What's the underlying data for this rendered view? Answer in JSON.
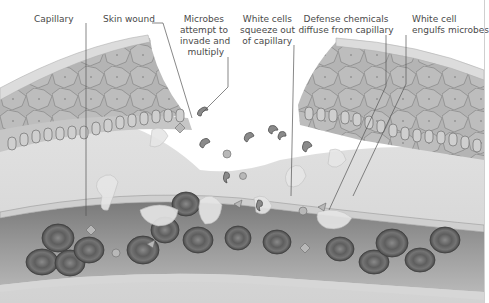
{
  "diagram": {
    "type": "illustration",
    "style": "grayscale",
    "labels": [
      {
        "id": "capillary",
        "text": "Capillary"
      },
      {
        "id": "skin_wound",
        "text": "Skin wound"
      },
      {
        "id": "microbes",
        "lines": [
          "Microbes",
          "attempt to",
          "invade and",
          "multiply"
        ]
      },
      {
        "id": "white_cells_squeeze",
        "lines": [
          "White cells",
          "squeeze out",
          "of capillary"
        ]
      },
      {
        "id": "defense_chemicals",
        "lines": [
          "Defense chemicals",
          "diffuse from capillary"
        ]
      },
      {
        "id": "white_cell_engulfs",
        "lines": [
          "White cell",
          "engulfs microbes"
        ]
      }
    ],
    "structures": [
      "epidermis",
      "basal cell layer",
      "dermis",
      "capillary wall",
      "red blood cells",
      "white blood cells",
      "microbes",
      "defense chemicals"
    ],
    "colors": {
      "background": "#ffffff",
      "label_text": "#4a4a4a",
      "leader_line": "#555555",
      "skin_cells": "#a8a8a8",
      "dermis": "#d8d8d8",
      "vessel_lumen": "#8a8a8a",
      "red_cell": "#6e6e6e"
    }
  }
}
